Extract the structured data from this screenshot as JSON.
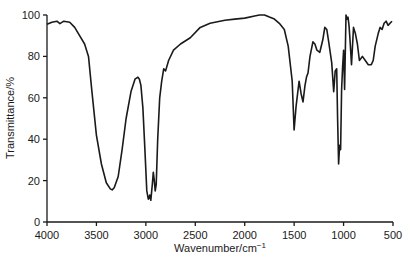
{
  "chart_data": {
    "type": "line",
    "title": "",
    "xlabel": "Wavenumber/cm",
    "xlabel_superscript": "−1",
    "ylabel": "Transmittance/%",
    "xlim": [
      4000,
      500
    ],
    "ylim": [
      0,
      100
    ],
    "x_reversed": true,
    "grid": false,
    "legend": null,
    "x_ticks": [
      4000,
      3500,
      3000,
      2500,
      2000,
      1500,
      1000,
      500
    ],
    "y_ticks": [
      0,
      20,
      40,
      60,
      80,
      100
    ],
    "series": [
      {
        "name": "IR spectrum",
        "color": "#1a1a1a",
        "x": [
          4000,
          3950,
          3900,
          3870,
          3830,
          3770,
          3720,
          3670,
          3620,
          3580,
          3550,
          3500,
          3450,
          3400,
          3360,
          3340,
          3320,
          3280,
          3240,
          3200,
          3150,
          3110,
          3080,
          3065,
          3050,
          3030,
          3010,
          2990,
          2975,
          2960,
          2950,
          2935,
          2925,
          2915,
          2905,
          2895,
          2880,
          2860,
          2840,
          2820,
          2800,
          2770,
          2720,
          2650,
          2550,
          2450,
          2350,
          2200,
          2100,
          2000,
          1900,
          1850,
          1800,
          1750,
          1700,
          1650,
          1600,
          1560,
          1520,
          1500,
          1480,
          1465,
          1450,
          1430,
          1410,
          1390,
          1375,
          1360,
          1340,
          1310,
          1290,
          1270,
          1240,
          1210,
          1190,
          1170,
          1150,
          1120,
          1100,
          1085,
          1070,
          1060,
          1050,
          1040,
          1030,
          1020,
          1010,
          1000,
          990,
          975,
          965,
          955,
          945,
          935,
          920,
          900,
          880,
          860,
          840,
          810,
          780,
          750,
          720,
          700,
          680,
          650,
          630,
          610,
          590,
          570,
          550,
          530,
          510
        ],
        "y": [
          95.5,
          96.5,
          97.0,
          95.8,
          97.0,
          96.5,
          94.0,
          90.0,
          86.0,
          80.0,
          65.0,
          42.0,
          28.0,
          19.0,
          16.0,
          15.5,
          16.5,
          22.0,
          35.0,
          50.0,
          63.0,
          69.0,
          70.0,
          69.0,
          66.0,
          55.0,
          35.0,
          15.0,
          11.0,
          13.0,
          10.5,
          18.0,
          24.0,
          20.0,
          15.0,
          18.0,
          40.0,
          60.0,
          68.0,
          74.0,
          73.0,
          78.0,
          83.0,
          86.0,
          89.0,
          94.0,
          96.0,
          97.5,
          98.0,
          98.5,
          99.5,
          100.0,
          100.0,
          99.0,
          98.0,
          96.0,
          93.0,
          85.0,
          68.0,
          44.5,
          56.0,
          62.0,
          68.0,
          62.0,
          58.0,
          66.0,
          70.0,
          72.0,
          80.0,
          87.0,
          86.0,
          83.0,
          82.0,
          88.0,
          94.0,
          93.0,
          87.0,
          77.0,
          63.0,
          73.0,
          74.0,
          50.0,
          28.0,
          37.0,
          35.0,
          64.0,
          75.0,
          83.0,
          64.0,
          100.0,
          98.0,
          99.0,
          95.0,
          88.0,
          76.0,
          94.0,
          91.0,
          86.0,
          78.0,
          80.0,
          78.0,
          76.0,
          76.0,
          78.0,
          85.0,
          91.0,
          94.0,
          93.0,
          96.0,
          97.0,
          95.0,
          96.0,
          97.0
        ]
      }
    ],
    "annotations": []
  },
  "plot_area": {
    "x_px": [
      47,
      393
    ],
    "y_px": [
      222,
      15
    ]
  }
}
